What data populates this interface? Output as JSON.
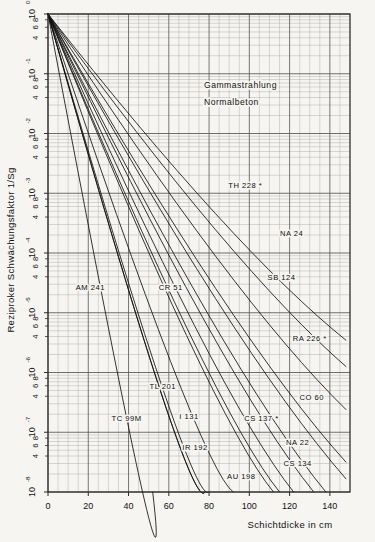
{
  "figure": {
    "background_color": "#f6f5f1",
    "frame_color": "#2a2a2a",
    "grid_major_color": "#5e5e5e",
    "grid_minor_color": "#a9a9a9",
    "curve_color": "#111111"
  },
  "annotation": {
    "line1": "Gammastrahlung",
    "line2": "Normalbeton"
  },
  "axes": {
    "y_title": "Reziproker Schwächungsfaktor 1/Sg",
    "x_title": "Schichtdicke in cm",
    "x_ticks": [
      "0",
      "20",
      "40",
      "60",
      "80",
      "100",
      "120",
      "140"
    ],
    "x_tick_values": [
      0,
      20,
      40,
      60,
      80,
      100,
      120,
      140
    ],
    "x_min": 0,
    "x_max": 150,
    "y_min_exp": -8,
    "y_max_exp": 0,
    "y_decade_labels": [
      "10",
      "10",
      "10",
      "10",
      "10",
      "10",
      "10",
      "10",
      "10"
    ],
    "y_exponents": [
      "0",
      "-1",
      "-2",
      "-3",
      "-4",
      "-5",
      "-6",
      "-7",
      "-8"
    ],
    "y_minor_labels": [
      "4",
      "6",
      "8"
    ],
    "y_minor_values": [
      4,
      6,
      8
    ],
    "grid": "log-y-linear-x"
  },
  "chart_data": {
    "type": "line",
    "xlabel": "Schichtdicke in cm",
    "ylabel": "Reziproker Schwächungsfaktor 1/Sg",
    "xlim": [
      0,
      150
    ],
    "ylim": [
      1e-08,
      1
    ],
    "yscale": "log",
    "xscale": "linear",
    "grid": true,
    "legend": "inline-labels",
    "note": "All curves start at x=0, y=1 (10^0) and decay exponentially; label_x/label_y give the position of the inline curve label; end_x/end_y give the terminal point of each drawn curve.",
    "series": [
      {
        "name": "AM 241",
        "label": "AM 241",
        "asterisk": false,
        "end_x": 52,
        "end_y_exp": -8.0,
        "label_x": 21,
        "label_y_exp": -4.62
      },
      {
        "name": "TC 99M",
        "label": "TC 99M",
        "asterisk": false,
        "end_x": 78,
        "end_y_exp": -8.0,
        "label_x": 39,
        "label_y_exp": -6.82
      },
      {
        "name": "TL 201",
        "label": "TL 201",
        "asterisk": false,
        "end_x": 80,
        "end_y_exp": -8.0,
        "label_x": 57,
        "label_y_exp": -6.28
      },
      {
        "name": "CR 51",
        "label": "CR 51",
        "asterisk": false,
        "end_x": 78,
        "end_y_exp": -8.0,
        "label_x": 61,
        "label_y_exp": -4.62
      },
      {
        "name": "I 131",
        "label": "I 131",
        "asterisk": false,
        "end_x": 92,
        "end_y_exp": -8.0,
        "label_x": 70,
        "label_y_exp": -6.78
      },
      {
        "name": "IR 192",
        "label": "IR 192",
        "asterisk": false,
        "end_x": 112,
        "end_y_exp": -8.0,
        "label_x": 73,
        "label_y_exp": -7.3
      },
      {
        "name": "AU 198",
        "label": "AU 198",
        "asterisk": false,
        "end_x": 115,
        "end_y_exp": -8.0,
        "label_x": 96,
        "label_y_exp": -7.78
      },
      {
        "name": "CS 137",
        "label": "CS 137",
        "asterisk": true,
        "end_x": 122,
        "end_y_exp": -8.0,
        "label_x": 106,
        "label_y_exp": -6.82
      },
      {
        "name": "CS 134",
        "label": "CS 134",
        "asterisk": false,
        "end_x": 138,
        "end_y_exp": -8.0,
        "label_x": 124,
        "label_y_exp": -7.56
      },
      {
        "name": "NA 22",
        "label": "NA 22",
        "asterisk": false,
        "end_x": 132,
        "end_y_exp": -8.0,
        "label_x": 124,
        "label_y_exp": -7.22
      },
      {
        "name": "RA 226",
        "label": "RA 226",
        "asterisk": true,
        "end_x": 148,
        "end_y_exp": -7.5,
        "label_x": 130,
        "label_y_exp": -5.48
      },
      {
        "name": "CO 60",
        "label": "CO 60",
        "asterisk": false,
        "end_x": 148,
        "end_y_exp": -7.78,
        "label_x": 131,
        "label_y_exp": -6.46
      },
      {
        "name": "SB 124",
        "label": "SB 124",
        "asterisk": false,
        "end_x": 148,
        "end_y_exp": -6.62,
        "label_x": 116,
        "label_y_exp": -4.46
      },
      {
        "name": "NA 24",
        "label": "NA 24",
        "asterisk": false,
        "end_x": 148,
        "end_y_exp": -5.9,
        "label_x": 121,
        "label_y_exp": -3.72
      },
      {
        "name": "TH 228",
        "label": "TH 228",
        "asterisk": true,
        "end_x": 148,
        "end_y_exp": -5.46,
        "label_x": 98,
        "label_y_exp": -2.92
      }
    ]
  }
}
